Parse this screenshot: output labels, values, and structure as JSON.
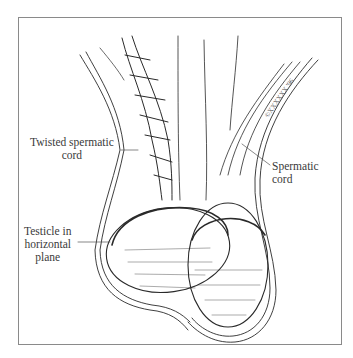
{
  "figure": {
    "type": "anatomical illustration",
    "labels": [
      {
        "id": "twisted-cord",
        "lines": [
          "Twisted spermatic",
          "cord"
        ]
      },
      {
        "id": "testicle-horizontal",
        "lines": [
          "Testicle in",
          "horizontal",
          "plane"
        ]
      },
      {
        "id": "spermatic-cord",
        "lines": [
          "Spermatic",
          "cord"
        ]
      }
    ],
    "signature": "©XXXXXX '96"
  },
  "colors": {
    "line": "#2a2a2a",
    "label": "#3a3a3a",
    "frame": "#8a8a8a",
    "background": "#ffffff"
  }
}
